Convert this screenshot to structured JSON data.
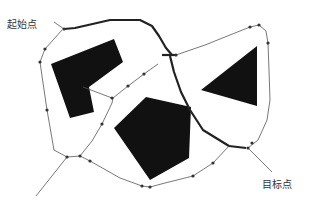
{
  "diagram": {
    "labels": {
      "start": "起始点",
      "goal": "目标点"
    },
    "colors": {
      "background": "#ffffff",
      "obstacle": "#111111",
      "thin_edge": "#555555",
      "path": "#222222",
      "node": "#333333",
      "label": "#333333"
    },
    "obstacles": [
      {
        "name": "l-shape",
        "points": "51,64 114,39 123,62 89,87 94,112 70,118"
      },
      {
        "name": "pentagon",
        "points": "114,128 146,97 191,107 189,158 150,180"
      },
      {
        "name": "triangle",
        "points": "201,90 257,46 257,106"
      }
    ],
    "thin_edges": [
      {
        "name": "start-left-down",
        "d": "M62,30 L45,49 L40,62 L42,76 L47,110 L54,150 L67,157"
      },
      {
        "name": "left-junction-down",
        "d": "M67,157 L36,196"
      },
      {
        "name": "left-junction-right",
        "d": "M67,157 L80,156"
      },
      {
        "name": "mid-up-to-inner",
        "d": "M80,156 L92,141 L102,124 L112,103 L113,98"
      },
      {
        "name": "inner-diag-left",
        "d": "M83,87 L112,98"
      },
      {
        "name": "inner-diag-right",
        "d": "M113,98 L128,86 L144,74 L158,64"
      },
      {
        "name": "bottom-left",
        "d": "M80,156 L90,161 L120,178 L142,186 L150,187"
      },
      {
        "name": "bottom-right",
        "d": "M150,187 L165,183 L193,176 L213,163 L229,146"
      },
      {
        "name": "top-right",
        "d": "M176,55 L205,45 L250,27 L259,25"
      },
      {
        "name": "right-side",
        "d": "M259,25 L266,31 L268,43 L269,70 L270,100 L267,120 L258,140 L248,148"
      },
      {
        "name": "goal-leader",
        "d": "M248,148 L272,172"
      },
      {
        "name": "start-leader",
        "d": "M54,22 L64,29"
      }
    ],
    "bold_path": [
      {
        "name": "start-to-top",
        "d": "M64,29 L75,28 L110,20 L140,20 L152,26 L159,36 L166,48 L172,55"
      },
      {
        "name": "junction-top",
        "d": "M162,55 L176,55"
      },
      {
        "name": "down-to-goal",
        "d": "M170,56 L174,72 L181,92 L190,110 L203,130 L229,146"
      },
      {
        "name": "goal-join",
        "d": "M229,146 L246,148"
      }
    ],
    "nodes": [
      {
        "x": 64,
        "y": 29
      },
      {
        "x": 45,
        "y": 49
      },
      {
        "x": 40,
        "y": 62
      },
      {
        "x": 47,
        "y": 110
      },
      {
        "x": 67,
        "y": 157
      },
      {
        "x": 80,
        "y": 156
      },
      {
        "x": 90,
        "y": 161
      },
      {
        "x": 102,
        "y": 124
      },
      {
        "x": 112,
        "y": 98
      },
      {
        "x": 128,
        "y": 86
      },
      {
        "x": 144,
        "y": 74
      },
      {
        "x": 142,
        "y": 186
      },
      {
        "x": 150,
        "y": 187
      },
      {
        "x": 193,
        "y": 176
      },
      {
        "x": 213,
        "y": 163
      },
      {
        "x": 176,
        "y": 55
      },
      {
        "x": 250,
        "y": 27
      },
      {
        "x": 259,
        "y": 25
      },
      {
        "x": 268,
        "y": 43
      },
      {
        "x": 248,
        "y": 148
      },
      {
        "x": 252,
        "y": 143
      }
    ]
  }
}
